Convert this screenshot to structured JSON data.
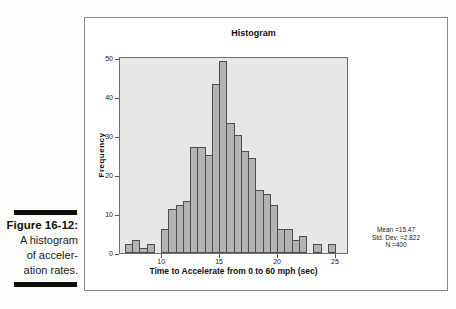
{
  "figure_caption": {
    "label": "Figure 16-12:",
    "lines": [
      "A histogram",
      "of acceler-",
      "ation rates."
    ]
  },
  "chart": {
    "title": "Histogram",
    "ylabel": "Frequency",
    "xlabel": "Time to Accelerate from 0 to 60 mph (sec)",
    "stats_lines": [
      "Mean =15.47",
      "Std. Dev. =2.822",
      "N =400"
    ]
  },
  "chart_data": {
    "type": "bar",
    "subtype": "histogram",
    "title": "Histogram",
    "xlabel": "Time to Accelerate from 0 to 60 mph (sec)",
    "ylabel": "Frequency",
    "bin_start": 6.875,
    "bin_width": 0.625,
    "counts": [
      2,
      3,
      1,
      2,
      0,
      6,
      11,
      12,
      13,
      27,
      27,
      25,
      43,
      49,
      33,
      30,
      26,
      24,
      16,
      15,
      12,
      6,
      6,
      3,
      4,
      0,
      2,
      0,
      2
    ],
    "n_total": 400,
    "x_ticks": [
      10,
      15,
      20,
      25
    ],
    "y_ticks": [
      0,
      10,
      20,
      30,
      40,
      50
    ],
    "ylim": [
      0,
      50.5
    ],
    "grid": false,
    "legend": false,
    "stats_annotation": {
      "mean": 15.47,
      "std_dev": 2.822,
      "n": 400,
      "position": "right"
    },
    "colors": {
      "bar_fill": "#b3b3b1",
      "bar_border": "#4d4d4b",
      "plot_background": "#e7e7e5",
      "frame_border": "#6e6e6e",
      "caption_bar": "#0d0d0d"
    }
  }
}
